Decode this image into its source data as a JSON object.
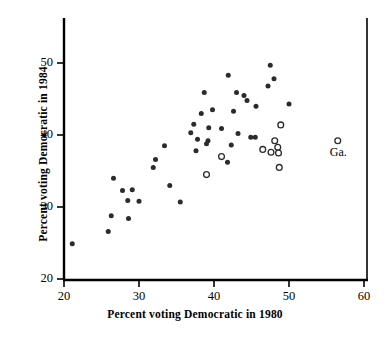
{
  "chart_data": {
    "type": "scatter",
    "title": "",
    "xlabel": "Percent voting Democratic in 1980",
    "ylabel": "Percent voting Democratic in 1984",
    "xlim": [
      20,
      61.5
    ],
    "ylim": [
      19,
      55
    ],
    "xticks": [
      20,
      30,
      40,
      50,
      60
    ],
    "yticks": [
      20,
      30,
      40,
      50
    ],
    "grid": false,
    "legend": null,
    "annotations": [
      {
        "text": "Ga.",
        "x": 56.5,
        "y": 37.5
      }
    ],
    "series": [
      {
        "name": "non-Southern states",
        "marker": "filled-circle",
        "color": "#2b2b2b",
        "points": [
          [
            21.1,
            24.9
          ],
          [
            25.9,
            26.6
          ],
          [
            26.3,
            28.8
          ],
          [
            26.6,
            34.0
          ],
          [
            27.8,
            32.3
          ],
          [
            28.5,
            30.9
          ],
          [
            28.6,
            28.4
          ],
          [
            29.1,
            32.4
          ],
          [
            30.0,
            30.8
          ],
          [
            31.9,
            35.5
          ],
          [
            32.2,
            36.6
          ],
          [
            33.4,
            38.5
          ],
          [
            34.1,
            33.0
          ],
          [
            35.5,
            30.7
          ],
          [
            36.9,
            40.3
          ],
          [
            37.3,
            41.5
          ],
          [
            37.6,
            37.8
          ],
          [
            37.8,
            39.4
          ],
          [
            38.3,
            43.0
          ],
          [
            38.7,
            45.9
          ],
          [
            39.0,
            38.8
          ],
          [
            39.2,
            39.2
          ],
          [
            39.3,
            41.0
          ],
          [
            39.8,
            43.5
          ],
          [
            41.0,
            40.9
          ],
          [
            41.8,
            36.2
          ],
          [
            41.9,
            48.3
          ],
          [
            42.3,
            38.6
          ],
          [
            42.6,
            43.3
          ],
          [
            43.0,
            45.9
          ],
          [
            43.2,
            40.2
          ],
          [
            44.0,
            45.5
          ],
          [
            44.4,
            44.8
          ],
          [
            44.9,
            39.7
          ],
          [
            45.5,
            39.7
          ],
          [
            45.6,
            44.0
          ],
          [
            47.2,
            46.8
          ],
          [
            47.5,
            49.7
          ],
          [
            48.0,
            47.8
          ],
          [
            50.0,
            44.3
          ]
        ]
      },
      {
        "name": "Southern states",
        "marker": "open-circle",
        "color": "#2b2b2b",
        "points": [
          [
            39.0,
            34.5
          ],
          [
            41.0,
            37.0
          ],
          [
            46.5,
            38.0
          ],
          [
            47.6,
            37.6
          ],
          [
            48.1,
            39.2
          ],
          [
            48.5,
            38.3
          ],
          [
            48.6,
            37.5
          ],
          [
            48.7,
            35.5
          ],
          [
            48.9,
            41.4
          ],
          [
            56.5,
            39.2
          ]
        ]
      }
    ]
  },
  "axes": {
    "x_tick_labels": [
      "20",
      "30",
      "40",
      "50",
      "60"
    ],
    "y_tick_labels": [
      "50",
      "40",
      "30",
      "20"
    ]
  }
}
